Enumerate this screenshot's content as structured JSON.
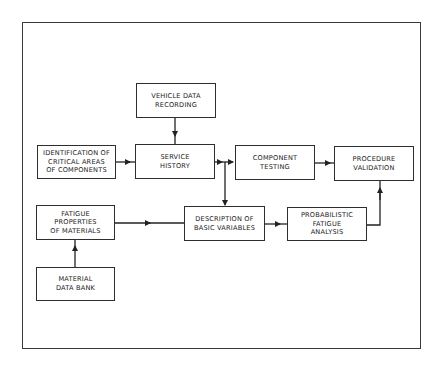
{
  "diagram": {
    "nodes": [
      {
        "id": "vehicle",
        "label": "VEHICLE DATA\nRECORDING"
      },
      {
        "id": "identification",
        "label": "IDENTIFICATION OF\nCRITICAL AREAS\nOF COMPONENTS"
      },
      {
        "id": "service",
        "label": "SERVICE\nHISTORY"
      },
      {
        "id": "component",
        "label": "COMPONENT\nTESTING"
      },
      {
        "id": "procedure",
        "label": "PROCEDURE\nVALIDATION"
      },
      {
        "id": "fatigue_props",
        "label": "FATIGUE\nPROPERTIES\nOF MATERIALS"
      },
      {
        "id": "description",
        "label": "DESCRIPTION OF\nBASIC VARIABLES"
      },
      {
        "id": "probabilistic",
        "label": "PROBABILISTIC\nFATIGUE\nANALYSIS"
      },
      {
        "id": "material_bank",
        "label": "MATERIAL\nDATA BANK"
      }
    ],
    "edges": [
      {
        "from": "vehicle",
        "to": "service"
      },
      {
        "from": "identification",
        "to": "service"
      },
      {
        "from": "service",
        "to": "component"
      },
      {
        "from": "service",
        "to": "description"
      },
      {
        "from": "component",
        "to": "procedure"
      },
      {
        "from": "fatigue_props",
        "to": "description"
      },
      {
        "from": "description",
        "to": "probabilistic"
      },
      {
        "from": "probabilistic",
        "to": "procedure"
      },
      {
        "from": "material_bank",
        "to": "fatigue_props"
      }
    ]
  }
}
